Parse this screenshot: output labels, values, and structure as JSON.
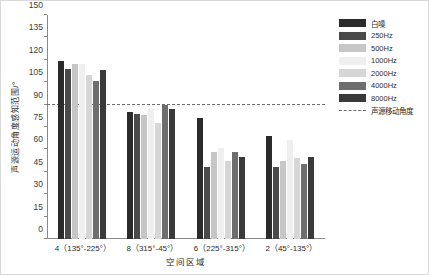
{
  "chart_data": {
    "type": "bar",
    "title": "",
    "xlabel": "空间区域",
    "ylabel": "声源运动角度感知范围/°",
    "ylim": [
      0,
      150
    ],
    "yticks": [
      0,
      15,
      30,
      45,
      60,
      75,
      90,
      105,
      120,
      135,
      150
    ],
    "grid": false,
    "legend_position": "right",
    "categories": [
      "4（135°-225°）",
      "8（315°-45°）",
      "6（225°-315°）",
      "2（45°-135°）"
    ],
    "series": [
      {
        "name": "白噪",
        "color": "#2b2b2b",
        "values": [
          119,
          85,
          81,
          69
        ]
      },
      {
        "name": "250Hz",
        "color": "#4a4a4a",
        "values": [
          114,
          84,
          48,
          48
        ]
      },
      {
        "name": "500Hz",
        "color": "#c6c6c6",
        "values": [
          117,
          83,
          58,
          52
        ]
      },
      {
        "name": "1000Hz",
        "color": "#efefef",
        "values": [
          117,
          87,
          61,
          66
        ]
      },
      {
        "name": "2000Hz",
        "color": "#d6d6d6",
        "values": [
          110,
          78,
          52,
          54
        ]
      },
      {
        "name": "4000Hz",
        "color": "#6e6e6e",
        "values": [
          106,
          90,
          58,
          50
        ]
      },
      {
        "name": "8000Hz",
        "color": "#3a3a3a",
        "values": [
          113,
          87,
          55,
          55
        ]
      }
    ],
    "annotations": [
      {
        "name": "声源移动角度",
        "type": "hline",
        "value": 90,
        "style": "dashed",
        "color": "#6e6e6e"
      }
    ]
  },
  "legend": {
    "entries": [
      {
        "label": "白噪"
      },
      {
        "label": "250Hz"
      },
      {
        "label": "500Hz"
      },
      {
        "label": "1000Hz"
      },
      {
        "label": "2000Hz"
      },
      {
        "label": "4000Hz"
      },
      {
        "label": "8000Hz"
      }
    ],
    "reference_label": "声源移动角度"
  }
}
